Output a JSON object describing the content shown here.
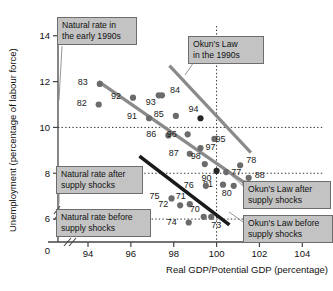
{
  "chart_data": {
    "type": "scatter",
    "title": "",
    "xlabel": "Real GDP/Potential GDP (percentage)",
    "ylabel": "Unemployment (percentage of labour force)",
    "xlim": [
      92.6,
      105.2
    ],
    "ylim": [
      5.0,
      14.6
    ],
    "xticks": [
      94,
      96,
      98,
      100,
      102,
      104
    ],
    "yticks": [
      6,
      8,
      10,
      12,
      14
    ],
    "x_origin_label": "0",
    "axis_break": true,
    "grid": false,
    "reference_lines": [
      {
        "name": "natural-rate-early-1990s",
        "orientation": "horizontal",
        "value": 10,
        "style": "dotted"
      },
      {
        "name": "natural-rate-after-supply-shocks",
        "orientation": "horizontal",
        "value": 8,
        "style": "dotted"
      },
      {
        "name": "natural-rate-before-supply-shocks",
        "orientation": "horizontal",
        "value": 6,
        "style": "dotted"
      },
      {
        "name": "potential-gdp-vertical",
        "orientation": "vertical",
        "value": 100,
        "style": "dotted"
      }
    ],
    "points": [
      {
        "label": "83",
        "x": 94.55,
        "y": 11.9
      },
      {
        "label": "82",
        "x": 94.5,
        "y": 11.0
      },
      {
        "label": "92",
        "x": 96.1,
        "y": 11.3
      },
      {
        "label": "93",
        "x": 97.3,
        "y": 11.4
      },
      {
        "label": "84",
        "x": 97.45,
        "y": 11.4
      },
      {
        "label": "91",
        "x": 96.85,
        "y": 10.4
      },
      {
        "label": "85",
        "x": 98.1,
        "y": 10.5
      },
      {
        "label": "94",
        "x": 99.25,
        "y": 10.4
      },
      {
        "label": "86",
        "x": 97.75,
        "y": 9.65
      },
      {
        "label": "96",
        "x": 98.65,
        "y": 9.7
      },
      {
        "label": "95",
        "x": 99.9,
        "y": 9.5
      },
      {
        "label": "87",
        "x": 98.75,
        "y": 8.85
      },
      {
        "label": "97",
        "x": 99.25,
        "y": 9.1
      },
      {
        "label": "98",
        "x": 99.45,
        "y": 8.4
      },
      {
        "label": "90",
        "x": 100.0,
        "y": 8.1
      },
      {
        "label": "77",
        "x": 100.45,
        "y": 8.05
      },
      {
        "label": "78",
        "x": 101.1,
        "y": 8.35
      },
      {
        "label": "88",
        "x": 101.5,
        "y": 7.8
      },
      {
        "label": "89",
        "x": 101.35,
        "y": 7.55
      },
      {
        "label": "79",
        "x": 102.5,
        "y": 7.5
      },
      {
        "label": "80",
        "x": 100.8,
        "y": 7.45
      },
      {
        "label": "81",
        "x": 100.3,
        "y": 7.5
      },
      {
        "label": "76",
        "x": 99.5,
        "y": 7.45
      },
      {
        "label": "75",
        "x": 97.9,
        "y": 6.9
      },
      {
        "label": "72",
        "x": 98.3,
        "y": 6.6
      },
      {
        "label": "71",
        "x": 98.75,
        "y": 6.65
      },
      {
        "label": "70",
        "x": 99.4,
        "y": 6.1
      },
      {
        "label": "73",
        "x": 99.75,
        "y": 6.1
      },
      {
        "label": "74",
        "x": 98.7,
        "y": 5.85
      }
    ],
    "trend_lines": [
      {
        "name": "okuns-law-1990s",
        "color": "#8a8a8a",
        "x1": 97.8,
        "y1": 12.7,
        "x2": 101.6,
        "y2": 8.9
      },
      {
        "name": "okuns-law-after-supply-shocks",
        "color": "#8a8a8a",
        "x1": 94.5,
        "y1": 12.0,
        "x2": 101.9,
        "y2": 7.2
      },
      {
        "name": "okuns-law-before-supply-shocks",
        "color": "#1a1a1a",
        "x1": 96.4,
        "y1": 8.75,
        "x2": 100.6,
        "y2": 5.75
      }
    ]
  },
  "callouts": [
    {
      "name": "callout-natural-rate-early-1990s",
      "text": "Natural rate in\nthe early 1990s"
    },
    {
      "name": "callout-okuns-law-1990s",
      "text": "Okun's Law\nin the 1990s"
    },
    {
      "name": "callout-natural-rate-after-supply-shocks",
      "text": "Natural rate after\nsupply shocks"
    },
    {
      "name": "callout-natural-rate-before-supply-shocks",
      "text": "Natural rate before\nsupply shocks"
    },
    {
      "name": "callout-okuns-law-after-supply-shocks",
      "text": "Okun's Law after\nsupply shocks"
    },
    {
      "name": "callout-okuns-law-before-supply-shocks",
      "text": "Okun's Law before\nsupply shocks"
    }
  ]
}
